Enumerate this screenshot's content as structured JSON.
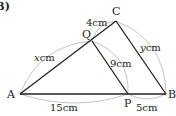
{
  "problem_number": "(3)",
  "points": {
    "A": {
      "label": "A",
      "x": 20,
      "y": 94
    },
    "P": {
      "label": "P",
      "x": 128,
      "y": 94
    },
    "B": {
      "label": "B",
      "x": 166,
      "y": 94
    },
    "C": {
      "label": "C",
      "x": 116,
      "y": 21
    },
    "Q": {
      "label": "Q",
      "x": 92,
      "y": 41
    }
  },
  "measures": {
    "AQ": "x cm",
    "QC": "4 cm",
    "QP": "9 cm",
    "CB": "y cm",
    "AP": "15 cm",
    "PB": "5 cm"
  },
  "labels": {
    "A": "A",
    "B": "B",
    "C": "C",
    "P": "P",
    "Q": "Q",
    "x_var": "x",
    "y_var": "y",
    "cm": "cm",
    "qc_len": "4cm",
    "qp_len": "9cm",
    "ap_len": "15cm",
    "pb_len": "5cm"
  },
  "colors": {
    "line": "#222222",
    "arc": "#999999"
  }
}
